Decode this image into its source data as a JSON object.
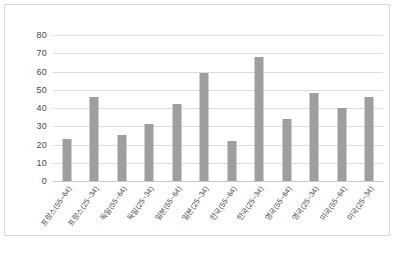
{
  "chart_data": {
    "type": "bar",
    "title": "",
    "subtitle": "",
    "xlabel": "",
    "ylabel": "",
    "ylim": [
      0,
      80
    ],
    "ytick_step": 10,
    "yticks": [
      "0",
      "10",
      "20",
      "30",
      "40",
      "50",
      "60",
      "70",
      "80"
    ],
    "grid": true,
    "legend": false,
    "bar_color": "#9e9e9e",
    "gridline_color": "#dcdcdc",
    "categories": [
      "프랑스(55~64)",
      "프랑스(25~34)",
      "독일(55~64)",
      "독일(25~34)",
      "일본(55~64)",
      "일본(25~34)",
      "한국(55~64)",
      "한국(25~34)",
      "영국(55~64)",
      "영국(25~34)",
      "미국(55~64)",
      "미국(25~34)"
    ],
    "values": [
      23,
      46,
      25,
      31,
      42,
      59,
      22,
      68,
      34,
      48,
      40,
      46
    ]
  },
  "caption": {
    "text": ""
  }
}
